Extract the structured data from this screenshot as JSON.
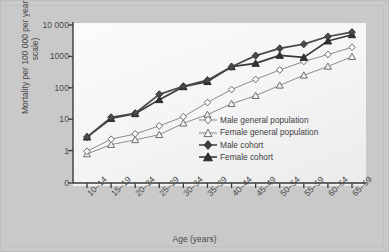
{
  "chart_data": {
    "type": "line",
    "title": "",
    "xlabel": "Age (years)",
    "ylabel": "Mortality per 100 000 per year (log scale)",
    "yscale": "log",
    "ylim": [
      0.6,
      10000
    ],
    "grid": false,
    "legend_position": "inside-center-right",
    "y_ticks": [
      {
        "value": 10000,
        "label": "10 000"
      },
      {
        "value": 1000,
        "label": "1000"
      },
      {
        "value": 100,
        "label": "100"
      },
      {
        "value": 10,
        "label": "10"
      },
      {
        "value": 1,
        "label": "1"
      },
      {
        "value": 0,
        "label": "0"
      }
    ],
    "categories": [
      "10–14",
      "15–19",
      "20–24",
      "25–29",
      "30–34",
      "35–39",
      "40–44",
      "45–49",
      "50–54",
      "55–59",
      "60–64",
      "65–69"
    ],
    "series": [
      {
        "name": "Male general population",
        "marker": "open-diamond",
        "color": "#8c8c8c",
        "values": [
          0.95,
          2.3,
          3.4,
          6.1,
          12.0,
          34.0,
          88.0,
          185.0,
          370.0,
          690.0,
          1150.0,
          1950.0
        ]
      },
      {
        "name": "Female general population",
        "marker": "open-triangle",
        "color": "#8c8c8c",
        "values": [
          0.78,
          1.55,
          2.2,
          3.2,
          7.4,
          14.0,
          31.0,
          56.0,
          120.0,
          250.0,
          480.0,
          980.0
        ]
      },
      {
        "name": "Male cohort",
        "marker": "filled-diamond",
        "color": "#4a4a4a",
        "values": [
          2.7,
          11.5,
          15.5,
          62.0,
          112.0,
          175.0,
          470.0,
          1060.0,
          1800.0,
          2450.0,
          4300.0,
          5900.0
        ]
      },
      {
        "name": "Female cohort",
        "marker": "filled-triangle",
        "color": "#3a3a3a",
        "values": [
          2.7,
          10.5,
          15.0,
          42.0,
          108.0,
          158.0,
          470.0,
          600.0,
          1080.0,
          930.0,
          3100.0,
          4900.0
        ]
      }
    ]
  },
  "legend": {
    "items": [
      {
        "label": "Male general population"
      },
      {
        "label": "Female general population"
      },
      {
        "label": "Male cohort"
      },
      {
        "label": "Female cohort"
      }
    ]
  },
  "colors": {
    "figure_background": "#c9c9c9",
    "plot_background": "#f6f6f6",
    "axis": "#3a3a3a",
    "general_population": "#8c8c8c",
    "cohort": "#4a4a4a"
  }
}
